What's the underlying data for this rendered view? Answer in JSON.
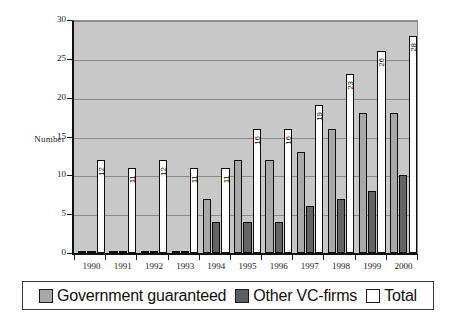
{
  "chart_data": {
    "type": "bar",
    "title": "",
    "xlabel": "",
    "ylabel": "Number",
    "ylim": [
      0,
      30
    ],
    "yticks": [
      0,
      5,
      10,
      15,
      20,
      25,
      30
    ],
    "grid": true,
    "legend_position": "bottom",
    "categories": [
      "1990",
      "1991",
      "1992",
      "1993",
      "1994",
      "1995",
      "1996",
      "1997",
      "1998",
      "1999",
      "2000"
    ],
    "series": [
      {
        "name": "Government guaranteed",
        "color": "#a8a8a8",
        "values": [
          0,
          0,
          0,
          0,
          7,
          12,
          12,
          13,
          16,
          18,
          18
        ],
        "data_labels": [
          "",
          "",
          "",
          "",
          "",
          "",
          "",
          "",
          "",
          "",
          ""
        ]
      },
      {
        "name": "Other VC-firms",
        "color": "#636363",
        "values": [
          0,
          0,
          0,
          0,
          4,
          4,
          4,
          6,
          7,
          8,
          10
        ],
        "data_labels": [
          "",
          "",
          "",
          "",
          "",
          "",
          "",
          "",
          "",
          "",
          ""
        ]
      },
      {
        "name": "Total",
        "color": "#ffffff",
        "values": [
          12,
          11,
          12,
          11,
          11,
          16,
          16,
          19,
          23,
          26,
          28
        ],
        "data_labels": [
          "12",
          "11",
          "12",
          "11",
          "11",
          "16",
          "16",
          "19",
          "23",
          "26",
          "28"
        ]
      }
    ]
  },
  "legend": {
    "items": [
      {
        "label": "Government guaranteed",
        "swatch": "gov"
      },
      {
        "label": "Other VC-firms",
        "swatch": "other"
      },
      {
        "label": "Total",
        "swatch": "total"
      }
    ]
  },
  "axes": {
    "y_title": "Number"
  }
}
